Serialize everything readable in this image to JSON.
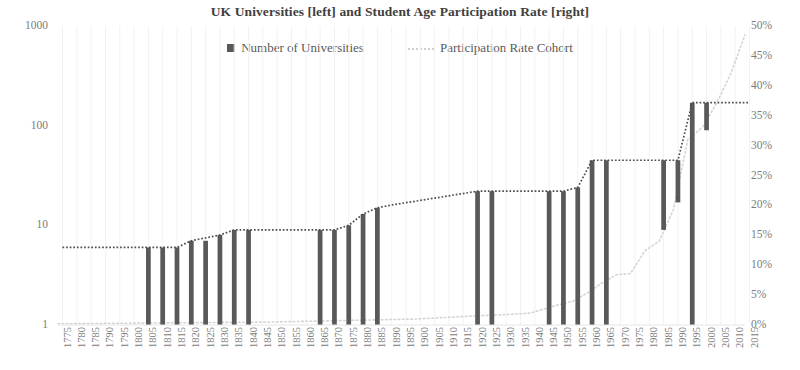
{
  "chart_data": {
    "type": "bar",
    "title": "UK Universities [left] and Student Age Participation Rate [right]",
    "xlabel": "",
    "ylabel": "",
    "y_left": {
      "scale": "log",
      "ticks": [
        "1",
        "10",
        "100",
        "1000"
      ],
      "tick_values": [
        1,
        10,
        100,
        1000
      ],
      "ylim": [
        1,
        1000
      ]
    },
    "y_right": {
      "scale": "linear",
      "ticks": [
        "0%",
        "5%",
        "10%",
        "15%",
        "20%",
        "25%",
        "30%",
        "35%",
        "40%",
        "45%",
        "50%"
      ],
      "tick_values": [
        0,
        5,
        10,
        15,
        20,
        25,
        30,
        35,
        40,
        45,
        50
      ],
      "ylim": [
        0,
        50
      ]
    },
    "xlim": [
      1775,
      2015
    ],
    "x_tick_step": 5,
    "grid": false,
    "legend_position": "top-center",
    "legend": [
      {
        "label": "Number of Universities",
        "marker": "square",
        "color": "#595959"
      },
      {
        "label": "Participation Rate Cohort",
        "marker": "dotted-line",
        "color": "#d0d0d0"
      }
    ],
    "x_ticks": [
      "1775",
      "1780",
      "1785",
      "1790",
      "1795",
      "1800",
      "1805",
      "1810",
      "1815",
      "1820",
      "1825",
      "1830",
      "1835",
      "1840",
      "1845",
      "1850",
      "1855",
      "1860",
      "1865",
      "1870",
      "1875",
      "1880",
      "1885",
      "1890",
      "1895",
      "1900",
      "1905",
      "1910",
      "1915",
      "1920",
      "1925",
      "1930",
      "1935",
      "1940",
      "1945",
      "1950",
      "1955",
      "1960",
      "1965",
      "1970",
      "1975",
      "1980",
      "1985",
      "1990",
      "1995",
      "2000",
      "2005",
      "2010",
      "2015"
    ],
    "series": [
      {
        "name": "Number of Universities",
        "type": "bar",
        "color": "#595959",
        "note": "Cumulative count of UK universities; bars drawn as floating increments from the previous level up to the new level on a log axis.",
        "points": [
          {
            "x": 1775,
            "value": 6,
            "prev": 6
          },
          {
            "x": 1780,
            "value": 6,
            "prev": 6
          },
          {
            "x": 1785,
            "value": 6,
            "prev": 6
          },
          {
            "x": 1790,
            "value": 6,
            "prev": 6
          },
          {
            "x": 1795,
            "value": 6,
            "prev": 6
          },
          {
            "x": 1800,
            "value": 6,
            "prev": 6
          },
          {
            "x": 1805,
            "value": 6,
            "prev": 1
          },
          {
            "x": 1810,
            "value": 6,
            "prev": 1
          },
          {
            "x": 1815,
            "value": 6,
            "prev": 1
          },
          {
            "x": 1820,
            "value": 7,
            "prev": 1
          },
          {
            "x": 1825,
            "value": 7,
            "prev": 1
          },
          {
            "x": 1830,
            "value": 8,
            "prev": 1
          },
          {
            "x": 1835,
            "value": 9,
            "prev": 1
          },
          {
            "x": 1840,
            "value": 9,
            "prev": 1
          },
          {
            "x": 1845,
            "value": 9,
            "prev": 9
          },
          {
            "x": 1850,
            "value": 9,
            "prev": 9
          },
          {
            "x": 1855,
            "value": 9,
            "prev": 9
          },
          {
            "x": 1860,
            "value": 9,
            "prev": 9
          },
          {
            "x": 1865,
            "value": 9,
            "prev": 1
          },
          {
            "x": 1870,
            "value": 9,
            "prev": 1
          },
          {
            "x": 1875,
            "value": 10,
            "prev": 1
          },
          {
            "x": 1880,
            "value": 13,
            "prev": 1
          },
          {
            "x": 1885,
            "value": 15,
            "prev": 1
          },
          {
            "x": 1890,
            "value": 16,
            "prev": 16
          },
          {
            "x": 1895,
            "value": 17,
            "prev": 17
          },
          {
            "x": 1900,
            "value": 18,
            "prev": 18
          },
          {
            "x": 1905,
            "value": 19,
            "prev": 19
          },
          {
            "x": 1910,
            "value": 20,
            "prev": 20
          },
          {
            "x": 1915,
            "value": 21,
            "prev": 21
          },
          {
            "x": 1920,
            "value": 22,
            "prev": 1
          },
          {
            "x": 1925,
            "value": 22,
            "prev": 1
          },
          {
            "x": 1930,
            "value": 22,
            "prev": 22
          },
          {
            "x": 1935,
            "value": 22,
            "prev": 22
          },
          {
            "x": 1940,
            "value": 22,
            "prev": 22
          },
          {
            "x": 1945,
            "value": 22,
            "prev": 1
          },
          {
            "x": 1950,
            "value": 22,
            "prev": 1
          },
          {
            "x": 1955,
            "value": 24,
            "prev": 1
          },
          {
            "x": 1960,
            "value": 45,
            "prev": 1
          },
          {
            "x": 1965,
            "value": 45,
            "prev": 1
          },
          {
            "x": 1970,
            "value": 45,
            "prev": 45
          },
          {
            "x": 1975,
            "value": 45,
            "prev": 45
          },
          {
            "x": 1980,
            "value": 45,
            "prev": 45
          },
          {
            "x": 1985,
            "value": 45,
            "prev": 9
          },
          {
            "x": 1990,
            "value": 45,
            "prev": 17
          },
          {
            "x": 1995,
            "value": 170,
            "prev": 1
          },
          {
            "x": 2000,
            "value": 170,
            "prev": 90
          },
          {
            "x": 2005,
            "value": 170,
            "prev": 170
          },
          {
            "x": 2010,
            "value": 170,
            "prev": 170
          },
          {
            "x": 2015,
            "value": 170,
            "prev": 170
          }
        ]
      },
      {
        "name": "Participation Rate Cohort",
        "type": "line",
        "style": "dotted",
        "color": "#d4d4d4",
        "axis": "right",
        "unit": "%",
        "points": [
          {
            "x": 1775,
            "value": 0.2
          },
          {
            "x": 1800,
            "value": 0.3
          },
          {
            "x": 1850,
            "value": 0.5
          },
          {
            "x": 1880,
            "value": 0.8
          },
          {
            "x": 1900,
            "value": 1.0
          },
          {
            "x": 1920,
            "value": 1.5
          },
          {
            "x": 1930,
            "value": 1.7
          },
          {
            "x": 1940,
            "value": 2.0
          },
          {
            "x": 1950,
            "value": 3.4
          },
          {
            "x": 1955,
            "value": 4.0
          },
          {
            "x": 1960,
            "value": 5.4
          },
          {
            "x": 1965,
            "value": 7.0
          },
          {
            "x": 1970,
            "value": 8.4
          },
          {
            "x": 1975,
            "value": 8.6
          },
          {
            "x": 1980,
            "value": 12.4
          },
          {
            "x": 1985,
            "value": 14.0
          },
          {
            "x": 1990,
            "value": 19.3
          },
          {
            "x": 1995,
            "value": 31.0
          },
          {
            "x": 2000,
            "value": 33.0
          },
          {
            "x": 2005,
            "value": 37.0
          },
          {
            "x": 2010,
            "value": 42.0
          },
          {
            "x": 2015,
            "value": 48.5
          }
        ]
      },
      {
        "name": "Cumulative level trace",
        "type": "line",
        "style": "dotted",
        "color": "#4d4d4d",
        "axis": "left",
        "note": "Dark dotted step line tracing the top of the university count.",
        "points": [
          {
            "x": 1775,
            "value": 6
          },
          {
            "x": 1805,
            "value": 6
          },
          {
            "x": 1815,
            "value": 6
          },
          {
            "x": 1820,
            "value": 7
          },
          {
            "x": 1830,
            "value": 8
          },
          {
            "x": 1835,
            "value": 9
          },
          {
            "x": 1870,
            "value": 9
          },
          {
            "x": 1875,
            "value": 10
          },
          {
            "x": 1880,
            "value": 13
          },
          {
            "x": 1885,
            "value": 15
          },
          {
            "x": 1890,
            "value": 16
          },
          {
            "x": 1920,
            "value": 22
          },
          {
            "x": 1950,
            "value": 22
          },
          {
            "x": 1955,
            "value": 24
          },
          {
            "x": 1960,
            "value": 45
          },
          {
            "x": 1990,
            "value": 45
          },
          {
            "x": 1995,
            "value": 170
          },
          {
            "x": 2015,
            "value": 170
          }
        ]
      }
    ]
  }
}
